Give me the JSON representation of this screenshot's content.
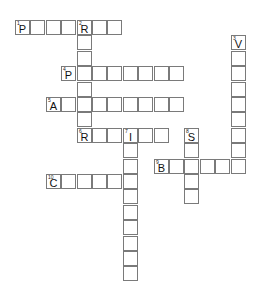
{
  "puzzle": {
    "cell_size": 15.4,
    "origin": {
      "x": 15,
      "y": 20
    },
    "words": [
      {
        "number": 1,
        "direction": "across",
        "row": 0,
        "col": 0,
        "length": 7,
        "first_letter": "P"
      },
      {
        "number": 2,
        "direction": "down",
        "row": 0,
        "col": 4,
        "length": 8,
        "first_letter": "R"
      },
      {
        "number": 3,
        "direction": "down",
        "row": 1,
        "col": 14,
        "length": 9,
        "first_letter": "V"
      },
      {
        "number": 4,
        "direction": "across",
        "row": 3,
        "col": 3,
        "length": 8,
        "first_letter": "P"
      },
      {
        "number": 5,
        "direction": "across",
        "row": 5,
        "col": 2,
        "length": 9,
        "first_letter": "A"
      },
      {
        "number": 6,
        "direction": "across",
        "row": 7,
        "col": 4,
        "length": 6,
        "first_letter": "R"
      },
      {
        "number": 7,
        "direction": "down",
        "row": 7,
        "col": 7,
        "length": 10,
        "first_letter": "I"
      },
      {
        "number": 8,
        "direction": "down",
        "row": 7,
        "col": 11,
        "length": 5,
        "first_letter": "S"
      },
      {
        "number": 9,
        "direction": "across",
        "row": 9,
        "col": 9,
        "length": 6,
        "first_letter": "B"
      },
      {
        "number": 10,
        "direction": "across",
        "row": 10,
        "col": 2,
        "length": 6,
        "first_letter": "C"
      }
    ]
  }
}
